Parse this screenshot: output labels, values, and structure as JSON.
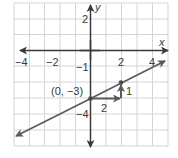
{
  "chart_data": {
    "type": "line",
    "title": "",
    "xlabel": "x",
    "ylabel": "y",
    "xlim": [
      -5,
      5
    ],
    "ylim": [
      -6,
      3
    ],
    "grid": true,
    "x_ticks": [
      {
        "value": -4,
        "label": "−4"
      },
      {
        "value": -2,
        "label": "−2"
      },
      {
        "value": 2,
        "label": "2"
      },
      {
        "value": 4,
        "label": "4"
      }
    ],
    "y_ticks": [
      {
        "value": 2,
        "label": "2"
      },
      {
        "value": -1,
        "label": "−1"
      },
      {
        "value": -4,
        "label": "−4"
      }
    ],
    "series": [
      {
        "name": "y = (1/2)x − 3",
        "slope": 0.5,
        "intercept": -3,
        "x_range": [
          -4.7,
          4.8
        ],
        "color": "#5a5a5a"
      }
    ],
    "points": [
      {
        "x": 0,
        "y": -3,
        "label": "(0, −3)"
      },
      {
        "x": 2,
        "y": -2,
        "label": ""
      }
    ],
    "annotations": [
      {
        "type": "run-arrow",
        "from": [
          0,
          -3
        ],
        "to": [
          2,
          -3
        ],
        "label": "2"
      },
      {
        "type": "rise-arrow",
        "from": [
          2,
          -3
        ],
        "to": [
          2,
          -2
        ],
        "label": "1"
      }
    ]
  }
}
